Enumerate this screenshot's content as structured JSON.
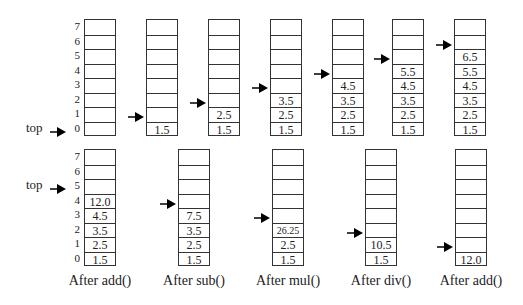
{
  "pointer_label": "top",
  "index_labels": [
    "7",
    "6",
    "5",
    "4",
    "3",
    "2",
    "1",
    "0"
  ],
  "top_row": [
    {
      "x": 84,
      "cells": [],
      "top_index": 0
    },
    {
      "x": 146,
      "cells": [
        "1.5"
      ],
      "top_index": 1
    },
    {
      "x": 208,
      "cells": [
        "1.5",
        "2.5"
      ],
      "top_index": 2
    },
    {
      "x": 270,
      "cells": [
        "1.5",
        "2.5",
        "3.5"
      ],
      "top_index": 3
    },
    {
      "x": 332,
      "cells": [
        "1.5",
        "2.5",
        "3.5",
        "4.5"
      ],
      "top_index": 4
    },
    {
      "x": 392,
      "cells": [
        "1.5",
        "2.5",
        "3.5",
        "4.5",
        "5.5"
      ],
      "top_index": 5
    },
    {
      "x": 454,
      "cells": [
        "1.5",
        "2.5",
        "3.5",
        "4.5",
        "5.5",
        "6.5"
      ],
      "top_index": 6
    }
  ],
  "bottom_row": [
    {
      "x": 84,
      "cells": [
        "1.5",
        "2.5",
        "3.5",
        "4.5",
        "12.0"
      ],
      "top_index": 5,
      "caption": "After add()"
    },
    {
      "x": 178,
      "cells": [
        "1.5",
        "2.5",
        "3.5",
        "7.5"
      ],
      "top_index": 4,
      "caption": "After sub()"
    },
    {
      "x": 272,
      "cells": [
        "1.5",
        "2.5",
        "26.25"
      ],
      "top_index": 3,
      "caption": "After mul()"
    },
    {
      "x": 365,
      "cells": [
        "1.5",
        "10.5"
      ],
      "top_index": 2,
      "caption": "After div()"
    },
    {
      "x": 455,
      "cells": [
        "12.0"
      ],
      "top_index": 1,
      "caption": "After add()"
    }
  ]
}
